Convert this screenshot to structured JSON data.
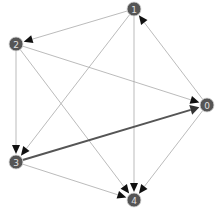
{
  "graph": {
    "type": "directed",
    "node_color": "#555555",
    "node_radius": 7,
    "edge_color": "#aaaaaa",
    "edge_thick_color": "#555555",
    "arrow_color": "#111111",
    "nodes": [
      {
        "id": "0",
        "label": "0",
        "x": 207,
        "y": 105
      },
      {
        "id": "1",
        "label": "1",
        "x": 134,
        "y": 9
      },
      {
        "id": "2",
        "label": "2",
        "x": 16,
        "y": 44
      },
      {
        "id": "3",
        "label": "3",
        "x": 16,
        "y": 162
      },
      {
        "id": "4",
        "label": "4",
        "x": 134,
        "y": 200
      }
    ],
    "edges": [
      {
        "from": "1",
        "to": "2",
        "weight": 1
      },
      {
        "from": "1",
        "to": "3",
        "weight": 1
      },
      {
        "from": "1",
        "to": "4",
        "weight": 1
      },
      {
        "from": "2",
        "to": "0",
        "weight": 1
      },
      {
        "from": "2",
        "to": "3",
        "weight": 1
      },
      {
        "from": "2",
        "to": "4",
        "weight": 1
      },
      {
        "from": "0",
        "to": "1",
        "weight": 1
      },
      {
        "from": "0",
        "to": "4",
        "weight": 1
      },
      {
        "from": "3",
        "to": "0",
        "weight": 2
      },
      {
        "from": "3",
        "to": "4",
        "weight": 1
      }
    ]
  }
}
